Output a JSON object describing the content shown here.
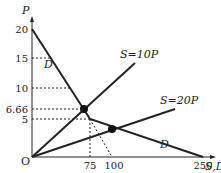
{
  "chart_data": {
    "type": "line",
    "title": "",
    "xlabel": "S,D",
    "ylabel": "P",
    "origin_label": "O",
    "x_ticks": [
      "75",
      "100",
      "250"
    ],
    "y_ticks": [
      "20",
      "15",
      "10",
      "6.66",
      "5"
    ],
    "series": [
      {
        "name": "D",
        "points": [
          [
            0,
            20
          ],
          [
            75,
            5
          ],
          [
            250,
            0
          ]
        ],
        "label_top": "D",
        "label_bottom": "D"
      },
      {
        "name": "S=10P",
        "points": [
          [
            0,
            0
          ],
          [
            120,
            12
          ]
        ]
      },
      {
        "name": "S=20P",
        "points": [
          [
            0,
            0
          ],
          [
            260,
            13
          ]
        ]
      }
    ],
    "equilibria": [
      {
        "x": 66.6,
        "y": 6.66,
        "label": "S=10P ∩ D"
      },
      {
        "x": 100,
        "y": 5,
        "label": "S=20P ∩ D"
      }
    ],
    "annotations": [
      "S=10P",
      "S=20P",
      "D",
      "D"
    ],
    "grid": false
  },
  "labels": {
    "p_axis": "P",
    "x_axis": "S,D",
    "origin": "O",
    "y20": "20",
    "y15": "15",
    "y10": "10",
    "y666": "6.66",
    "y5": "5",
    "x75": "75",
    "x100": "100",
    "x250": "250",
    "s10": "S=10P",
    "s20": "S=20P",
    "d_top": "D",
    "d_bottom": "D"
  }
}
